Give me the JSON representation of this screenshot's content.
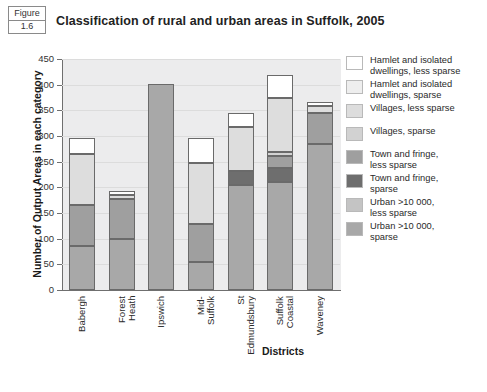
{
  "figure": {
    "word": "Figure",
    "number": "1.6"
  },
  "header": {
    "title": "Classification of rural and urban areas in Suffolk, 2005"
  },
  "axes": {
    "ylabel": "Number of Output Areas in each category",
    "xlabel": "Districts",
    "yticks": [
      "0",
      "50",
      "100",
      "150",
      "200",
      "250",
      "300",
      "350",
      "400",
      "450"
    ]
  },
  "legend": {
    "items": [
      {
        "label": "Hamlet and isolated\ndwellings, less sparse",
        "color": "#ffffff"
      },
      {
        "label": "Hamlet and isolated\ndwellings, sparse",
        "color": "#eeeeee"
      },
      {
        "label": "Villages, less sparse",
        "color": "#dddddd"
      },
      {
        "label": "Villages, sparse",
        "color": "#d2d2d2"
      },
      {
        "label": "Town and fringe,\nless sparse",
        "color": "#9f9f9f"
      },
      {
        "label": "Town and fringe,\nsparse",
        "color": "#6e6e6e"
      },
      {
        "label": "Urban >10 000,\nless sparse",
        "color": "#c4c4c4"
      },
      {
        "label": "Urban >10 000,\nsparse",
        "color": "#a8a8a8"
      }
    ]
  },
  "chart_data": {
    "type": "bar",
    "subtype": "stacked",
    "title": "Classification of rural and urban areas in Suffolk, 2005",
    "xlabel": "Districts",
    "ylabel": "Number of Output Areas in each category",
    "ylim": [
      0,
      450
    ],
    "ytick_step": 50,
    "grid": true,
    "legend_position": "right",
    "categories": [
      "Babergh",
      "Forest\nHeath",
      "Ipswich",
      "Mid-\nSuffolk",
      "St\nEdmundsbury",
      "Suffolk\nCoastal",
      "Waveney"
    ],
    "series": [
      {
        "name": "Urban >10 000, sparse",
        "color": "#a8a8a8",
        "values": [
          85,
          100,
          402,
          55,
          205,
          210,
          285
        ]
      },
      {
        "name": "Urban >10 000, less sparse",
        "color": "#c4c4c4",
        "values": [
          0,
          0,
          0,
          0,
          0,
          0,
          0
        ]
      },
      {
        "name": "Town and fringe, sparse",
        "color": "#6e6e6e",
        "values": [
          0,
          0,
          0,
          0,
          27,
          28,
          0
        ]
      },
      {
        "name": "Town and fringe, less sparse",
        "color": "#9f9f9f",
        "values": [
          80,
          78,
          0,
          73,
          0,
          24,
          60
        ]
      },
      {
        "name": "Villages, sparse",
        "color": "#d2d2d2",
        "values": [
          0,
          0,
          0,
          0,
          0,
          6,
          0
        ]
      },
      {
        "name": "Villages, less sparse",
        "color": "#dddddd",
        "values": [
          100,
          8,
          0,
          120,
          86,
          107,
          14
        ]
      },
      {
        "name": "Hamlet and isolated dwellings, sparse",
        "color": "#eeeeee",
        "values": [
          0,
          0,
          0,
          0,
          0,
          0,
          0
        ]
      },
      {
        "name": "Hamlet and isolated dwellings, less sparse",
        "color": "#ffffff",
        "values": [
          32,
          6,
          0,
          49,
          27,
          43,
          8
        ]
      }
    ],
    "totals": [
      297,
      192,
      402,
      297,
      345,
      418,
      367
    ]
  }
}
